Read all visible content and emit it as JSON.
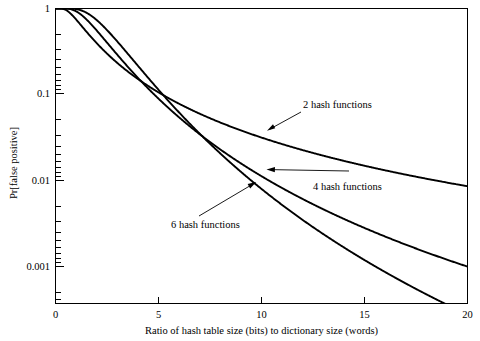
{
  "chart_data": {
    "type": "line",
    "title": "",
    "subtitle": "",
    "xlabel": "Ratio of hash table size (bits) to dictionary size (words)",
    "ylabel": "Pr[false positive]",
    "xlim": [
      0,
      20
    ],
    "ylim": [
      0.0003,
      1
    ],
    "yscale": "log",
    "xscale": "linear",
    "grid": false,
    "legend_position": "inline-annotations",
    "xticks": [
      0,
      5,
      10,
      15,
      20
    ],
    "xticklabels": [
      "0",
      "5",
      "10",
      "15",
      "20"
    ],
    "yticks": [
      1,
      0.1,
      0.01,
      0.001
    ],
    "yticklabels": [
      "1",
      "0.1",
      "0.01",
      "0.001"
    ],
    "x": [
      0,
      1,
      2,
      3,
      4,
      5,
      6,
      7,
      8,
      9,
      10,
      11,
      12,
      13,
      14,
      15,
      16,
      17,
      18,
      19,
      20
    ],
    "series": [
      {
        "name": "2 hash functions",
        "k": 2,
        "values": [
          1,
          0.3996,
          0.1548,
          0.0802,
          0.0489,
          0.0329,
          0.0237,
          0.018,
          0.0141,
          0.0114,
          0.00943,
          0.00794,
          0.00679,
          0.00588,
          0.00515,
          0.00455,
          0.00405,
          0.00364,
          0.00328,
          0.00298,
          0.00272
        ]
      },
      {
        "name": "4 hash functions",
        "k": 4,
        "values": [
          1,
          0.9218,
          0.2402,
          0.0643,
          0.024,
          0.0109,
          0.00561,
          0.00317,
          0.00192,
          0.00123,
          0.000822,
          0.000569,
          0.000406,
          0.000297,
          0.000222,
          0.000169,
          0.000131,
          0.000103,
          8.22e-05,
          6.64e-05,
          5.42e-05
        ]
      },
      {
        "name": "6 hash functions",
        "k": 6,
        "values": [
          1,
          0.9952,
          0.2864,
          0.0518,
          0.0137,
          0.00466,
          0.00187,
          0.000855,
          0.000429,
          0.000232,
          0.000134,
          8.08e-05,
          5.09e-05,
          3.32e-05,
          2.23e-05,
          1.54e-05,
          1.09e-05,
          7.8e-06,
          5.7e-06,
          4.3e-06,
          3.2e-06
        ]
      }
    ],
    "annotations": [
      {
        "text": "2 hash functions",
        "series": "2 hash functions"
      },
      {
        "text": "4 hash functions",
        "series": "4 hash functions"
      },
      {
        "text": "6 hash functions",
        "series": "6 hash functions"
      }
    ]
  },
  "axes": {
    "x_title": "Ratio of hash table size (bits) to dictionary size (words)",
    "y_title": "Pr[false positive]",
    "x_tick_0": "0",
    "x_tick_1": "5",
    "x_tick_2": "10",
    "x_tick_3": "15",
    "x_tick_4": "20",
    "y_tick_0": "1",
    "y_tick_1": "0.1",
    "y_tick_2": "0.01",
    "y_tick_3": "0.001"
  },
  "annotations": {
    "curve2_label": "2 hash functions",
    "curve4_label": "4 hash functions",
    "curve6_label": "6 hash functions"
  },
  "colors": {
    "background": "#ffffff",
    "ink": "#000000",
    "curve": "#000000"
  }
}
